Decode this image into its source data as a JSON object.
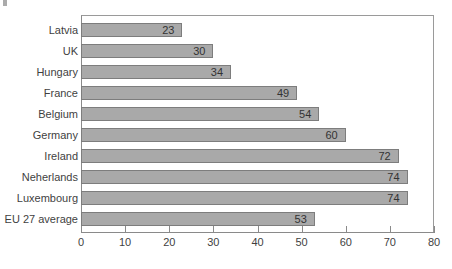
{
  "chart_data": {
    "type": "bar",
    "orientation": "horizontal",
    "title": "",
    "subtitle": "",
    "xlabel": "",
    "ylabel": "",
    "xlim": [
      0,
      80
    ],
    "xticks": [
      0,
      10,
      20,
      30,
      40,
      50,
      60,
      70,
      80
    ],
    "grid": false,
    "legend": null,
    "bar_color": "#a9a9a9",
    "bar_border_color": "#7d7d7d",
    "categories": [
      "Latvia",
      "UK",
      "Hungary",
      "France",
      "Belgium",
      "Germany",
      "Ireland",
      "Neherlands",
      "Luxembourg",
      "EU 27 average"
    ],
    "values": [
      23,
      30,
      34,
      49,
      54,
      60,
      72,
      74,
      74,
      53
    ],
    "data_labels": [
      "23",
      "30",
      "34",
      "49",
      "54",
      "60",
      "72",
      "74",
      "74",
      "53"
    ],
    "data_label_position": "inside-end"
  }
}
